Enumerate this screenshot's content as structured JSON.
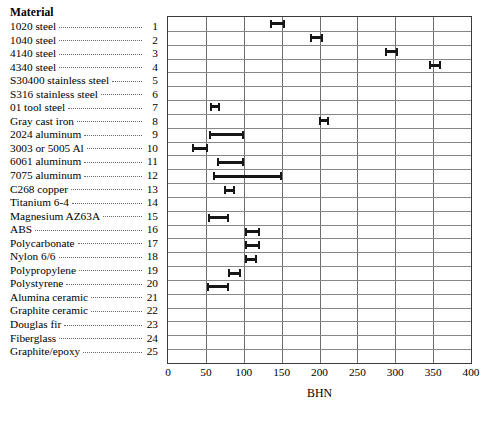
{
  "legend": {
    "title": "Material",
    "items": [
      {
        "label": "1020 steel",
        "number": "1"
      },
      {
        "label": "1040 steel",
        "number": "2"
      },
      {
        "label": "4140 steel",
        "number": "3"
      },
      {
        "label": "4340 steel",
        "number": "4"
      },
      {
        "label": "S30400 stainless steel",
        "number": "5"
      },
      {
        "label": "S316 stainless steel",
        "number": "6"
      },
      {
        "label": "01 tool steel",
        "number": "7"
      },
      {
        "label": "Gray cast iron",
        "number": "8"
      },
      {
        "label": "2024 aluminum",
        "number": "9"
      },
      {
        "label": "3003 or 5005 Al",
        "number": "10"
      },
      {
        "label": "6061 aluminum",
        "number": "11"
      },
      {
        "label": "7075 aluminum",
        "number": "12"
      },
      {
        "label": "C268 copper",
        "number": "13"
      },
      {
        "label": "Titanium 6-4",
        "number": "14"
      },
      {
        "label": "Magnesium AZ63A",
        "number": "15"
      },
      {
        "label": "ABS",
        "number": "16"
      },
      {
        "label": "Polycarbonate",
        "number": "17"
      },
      {
        "label": "Nylon 6/6",
        "number": "18"
      },
      {
        "label": "Polypropylene",
        "number": "19"
      },
      {
        "label": "Polystyrene",
        "number": "20"
      },
      {
        "label": "Alumina ceramic",
        "number": "21"
      },
      {
        "label": "Graphite ceramic",
        "number": "22"
      },
      {
        "label": "Douglas fir",
        "number": "23"
      },
      {
        "label": "Fiberglass",
        "number": "24"
      },
      {
        "label": "Graphite/epoxy",
        "number": "25"
      }
    ]
  },
  "chart_data": {
    "type": "bar",
    "orientation": "horizontal",
    "title": "",
    "xlabel": "BHN",
    "ylabel": "Material",
    "xlim": [
      0,
      400
    ],
    "xticks": [
      0,
      50,
      100,
      150,
      200,
      250,
      300,
      350,
      400
    ],
    "tick_labels": [
      "0",
      "50",
      "100",
      "150",
      "200",
      "250",
      "300",
      "350",
      "400"
    ],
    "grid": "both",
    "legend_position": "left-column",
    "bar_color": "#161616",
    "note": "Each row is a material (1-25); bars are hardness ranges in BHN. Rows without a bar have no data plotted.",
    "categories": [
      "1020 steel",
      "1040 steel",
      "4140 steel",
      "4340 steel",
      "S30400 stainless steel",
      "S316 stainless steel",
      "01 tool steel",
      "Gray cast iron",
      "2024 aluminum",
      "3003 or 5005 Al",
      "6061 aluminum",
      "7075 aluminum",
      "C268 copper",
      "Titanium 6-4",
      "Magnesium AZ63A",
      "ABS",
      "Polycarbonate",
      "Nylon 6/6",
      "Polypropylene",
      "Polystyrene",
      "Alumina ceramic",
      "Graphite ceramic",
      "Douglas fir",
      "Fiberglass",
      "Graphite/epoxy"
    ],
    "ranges": [
      {
        "index": 1,
        "material": "1020 steel",
        "low": 135,
        "high": 155
      },
      {
        "index": 2,
        "material": "1040 steel",
        "low": 188,
        "high": 205
      },
      {
        "index": 3,
        "material": "4140 steel",
        "low": 287,
        "high": 303
      },
      {
        "index": 4,
        "material": "4340 steel",
        "low": 344,
        "high": 360
      },
      {
        "index": 5,
        "material": "S30400 stainless steel",
        "low": null,
        "high": null
      },
      {
        "index": 6,
        "material": "S316 stainless steel",
        "low": null,
        "high": null
      },
      {
        "index": 7,
        "material": "01 tool steel",
        "low": 55,
        "high": 68
      },
      {
        "index": 8,
        "material": "Gray cast iron",
        "low": 199,
        "high": 213
      },
      {
        "index": 9,
        "material": "2024 aluminum",
        "low": 54,
        "high": 100
      },
      {
        "index": 10,
        "material": "3003 or 5005 Al",
        "low": 32,
        "high": 53
      },
      {
        "index": 11,
        "material": "6061 aluminum",
        "low": 65,
        "high": 100
      },
      {
        "index": 12,
        "material": "7075 aluminum",
        "low": 60,
        "high": 150
      },
      {
        "index": 13,
        "material": "C268 copper",
        "low": 74,
        "high": 88
      },
      {
        "index": 14,
        "material": "Titanium 6-4",
        "low": null,
        "high": null
      },
      {
        "index": 15,
        "material": "Magnesium AZ63A",
        "low": 53,
        "high": 80
      },
      {
        "index": 16,
        "material": "ABS",
        "low": 101,
        "high": 121
      },
      {
        "index": 17,
        "material": "Polycarbonate",
        "low": 101,
        "high": 122
      },
      {
        "index": 18,
        "material": "Nylon 6/6",
        "low": 102,
        "high": 117
      },
      {
        "index": 19,
        "material": "Polypropylene",
        "low": 79,
        "high": 96
      },
      {
        "index": 20,
        "material": "Polystyrene",
        "low": 51,
        "high": 80
      },
      {
        "index": 21,
        "material": "Alumina ceramic",
        "low": null,
        "high": null
      },
      {
        "index": 22,
        "material": "Graphite ceramic",
        "low": null,
        "high": null
      },
      {
        "index": 23,
        "material": "Douglas fir",
        "low": null,
        "high": null
      },
      {
        "index": 24,
        "material": "Fiberglass",
        "low": null,
        "high": null
      },
      {
        "index": 25,
        "material": "Graphite/epoxy",
        "low": null,
        "high": null
      }
    ]
  }
}
